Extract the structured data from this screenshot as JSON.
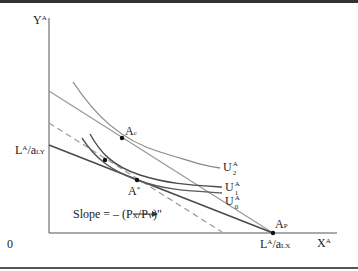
{
  "figure": {
    "y_axis_label": "Y",
    "y_axis_label_sup": "A",
    "x_axis_label": "X",
    "x_axis_label_sup": "A",
    "origin_label": "0",
    "y_intercept_label": {
      "L": "L",
      "L_sup": "A",
      "slash_a": "/a",
      "sub": "LY"
    },
    "x_intercept_label": {
      "L": "L",
      "L_sup": "A",
      "slash_a": "/a",
      "sub": "LX"
    },
    "points": [
      {
        "name": "A",
        "sub": "c"
      },
      {
        "name": "A",
        "sup": "*"
      },
      {
        "name": "A",
        "sub": "P"
      }
    ],
    "curves": [
      {
        "name": "U",
        "sup": "A",
        "sub": "2"
      },
      {
        "name": "U",
        "sup": "A",
        "sub": "1"
      },
      {
        "name": "U",
        "sup": "A",
        "sub": "0"
      }
    ],
    "slope_annotation": {
      "prefix": "Slope = – (P",
      "px_sub": "X",
      "mid": "/P",
      "py_sub": "Y",
      "suffix": ")\"",
      "arrow": "→"
    },
    "colors": {
      "axis": "#555555",
      "ppf": "#4a4a4a",
      "light_line": "#9a9a9a",
      "curve_light": "#8a8a8a",
      "curve_dark": "#4a4a4a",
      "dashed": "#9a9a9a",
      "border": "#333333"
    }
  }
}
